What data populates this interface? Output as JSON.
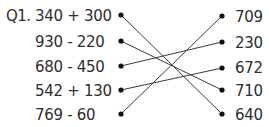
{
  "question_label": "Q1.",
  "left_items": [
    {
      "expr": "340 + 300",
      "y": 15
    },
    {
      "expr": "930 - 220",
      "y": 41
    },
    {
      "expr": "680 - 450",
      "y": 66
    },
    {
      "expr": "542 + 130",
      "y": 90
    },
    {
      "expr": "769 - 60",
      "y": 114
    }
  ],
  "right_items": [
    {
      "value": "709",
      "y": 16
    },
    {
      "value": "230",
      "y": 42
    },
    {
      "value": "672",
      "y": 68
    },
    {
      "value": "710",
      "y": 90
    },
    {
      "value": "640",
      "y": 114
    }
  ],
  "connections": [
    [
      0,
      4
    ],
    [
      1,
      3
    ],
    [
      2,
      1
    ],
    [
      3,
      2
    ],
    [
      4,
      0
    ]
  ],
  "colors": {
    "text": "#2e2e2e",
    "line": "#3a3a3a",
    "dot": "#111111"
  }
}
